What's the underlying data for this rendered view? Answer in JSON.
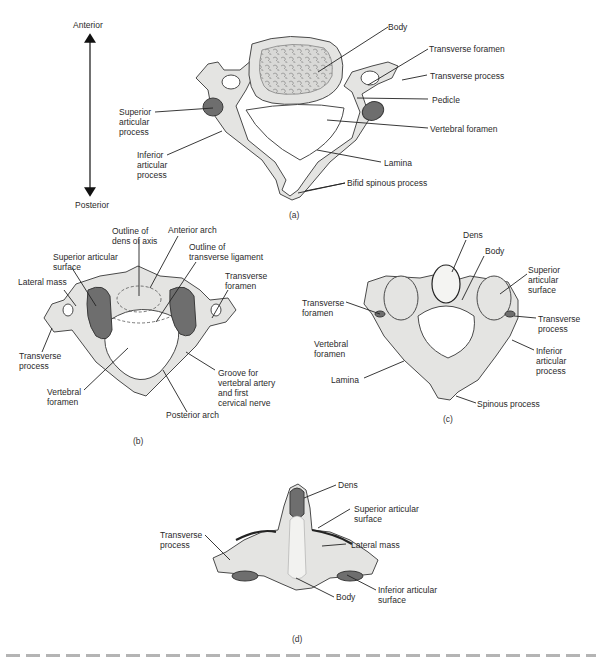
{
  "orientation": {
    "top_label": "Anterior",
    "bottom_label": "Posterior"
  },
  "panel_a": {
    "caption": "(a)",
    "labels": {
      "body": "Body",
      "transverse_foramen": "Transverse foramen",
      "transverse_process": "Transverse process",
      "pedicle": "Pedicle",
      "vertebral_foramen": "Vertebral foramen",
      "lamina": "Lamina",
      "bifid_spinous_process": "Bifid spinous process",
      "superior_articular_process": "Superior\narticular\nprocess",
      "inferior_articular_process": "Inferior\narticular\nprocess"
    }
  },
  "panel_b": {
    "caption": "(b)",
    "labels": {
      "outline_dens": "Outline of\ndens of axis",
      "anterior_arch": "Anterior arch",
      "outline_transverse_ligament": "Outline of\ntransverse ligament",
      "superior_articular_surface": "Superior articular\nsurface",
      "lateral_mass": "Lateral mass",
      "transverse_foramen": "Transverse\nforamen",
      "transverse_process": "Transverse\nprocess",
      "vertebral_foramen": "Vertebral\nforamen",
      "groove": "Groove for\nvertebral artery\nand first\ncervical nerve",
      "posterior_arch": "Posterior arch"
    }
  },
  "panel_c": {
    "caption": "(c)",
    "labels": {
      "dens": "Dens",
      "body": "Body",
      "superior_articular_surface": "Superior\narticular\nsurface",
      "transverse_foramen": "Transverse\nforamen",
      "transverse_process": "Transverse\nprocess",
      "vertebral_foramen": "Vertebral\nforamen",
      "inferior_articular_process": "Inferior\narticular\nprocess",
      "lamina": "Lamina",
      "spinous_process": "Spinous process"
    }
  },
  "panel_d": {
    "caption": "(d)",
    "labels": {
      "dens": "Dens",
      "superior_articular_surface": "Superior articular\nsurface",
      "transverse_process": "Transverse\nprocess",
      "lateral_mass": "Lateral mass",
      "inferior_articular_surface": "Inferior articular\nsurface",
      "body": "Body"
    }
  }
}
